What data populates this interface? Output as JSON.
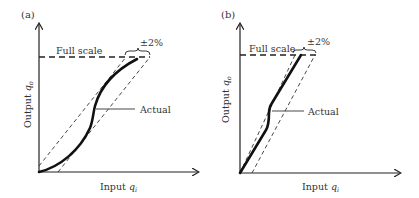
{
  "figure": {
    "panels": [
      {
        "id": "a",
        "label": "(a)",
        "x_axis_label": "Input",
        "x_axis_symbol": "q",
        "x_axis_subscript": "i",
        "y_axis_label": "Output",
        "y_axis_symbol": "q",
        "y_axis_subscript": "o",
        "full_scale_label": "Full scale",
        "tolerance_label": "±2%",
        "curve_label": "Actual",
        "curve_shape": "S-shaped nonlinear curve within ±2% band"
      },
      {
        "id": "b",
        "label": "(b)",
        "x_axis_label": "Input",
        "x_axis_symbol": "q",
        "x_axis_subscript": "i",
        "y_axis_label": "Output",
        "y_axis_symbol": "q",
        "y_axis_subscript": "o",
        "full_scale_label": "Full scale",
        "tolerance_label": "±2%",
        "curve_label": "Actual",
        "curve_shape": "Near-linear curve with small kink within ±2% band"
      }
    ],
    "colors": {
      "ink": "#222222",
      "text": "#333333",
      "background": "#ffffff"
    }
  }
}
